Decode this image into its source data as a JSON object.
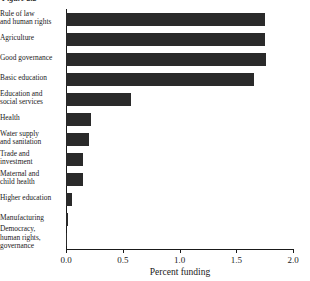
{
  "figure": {
    "caption_fragment": "Figure 2.2"
  },
  "chart_data": {
    "type": "bar",
    "orientation": "horizontal",
    "title": "",
    "subtitle": "",
    "xlabel": "Percent funding",
    "ylabel": "",
    "xlim": [
      0.0,
      2.0
    ],
    "xticks": [
      "0.0",
      "0.5",
      "1.0",
      "1.5",
      "2.0"
    ],
    "xtick_values": [
      0.0,
      0.5,
      1.0,
      1.5,
      2.0
    ],
    "grid": false,
    "legend": false,
    "bar_color": "#2a2a2a",
    "categories": [
      "Rule of law and human rights",
      "Agriculture",
      "Good governance",
      "Basic education",
      "Education and social services",
      "Health",
      "Water supply and sanitation",
      "Trade and investment",
      "Maternal and child health",
      "Higher education",
      "Manufacturing",
      "Democracy, human rights, governance"
    ],
    "category_lines": [
      [
        "Rule of law",
        "and human rights"
      ],
      [
        "Agriculture"
      ],
      [
        "Good governance"
      ],
      [
        "Basic education"
      ],
      [
        "Education and",
        "social services"
      ],
      [
        "Health"
      ],
      [
        "Water supply",
        "and sanitation"
      ],
      [
        "Trade and",
        "investment"
      ],
      [
        "Maternal and",
        "child health"
      ],
      [
        "Higher education"
      ],
      [
        "Manufacturing"
      ],
      [
        "Democracy,",
        "human rights,",
        "governance"
      ]
    ],
    "values": [
      1.75,
      1.75,
      1.76,
      1.66,
      0.57,
      0.22,
      0.2,
      0.15,
      0.15,
      0.05,
      0.02,
      0.005
    ]
  }
}
